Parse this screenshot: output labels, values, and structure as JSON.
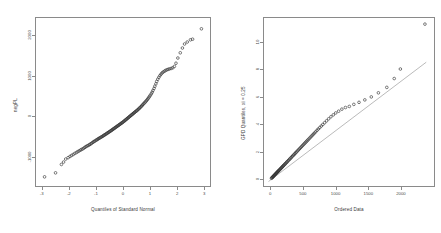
{
  "figure": {
    "background": "#ffffff",
    "frame_color": "#8a8a8a",
    "point_color": "#333333",
    "line_color": "#8a8a8a",
    "panels": 2
  },
  "chart_data": [
    {
      "type": "scatter",
      "panel": "left",
      "title": "",
      "xlabel": "Quantiles of Standard Normal",
      "ylabel": "negPL",
      "xlim": [
        -3.25,
        3.25
      ],
      "ylim": [
        -1750,
        2450
      ],
      "xticks": [
        -3,
        -2,
        -1,
        0,
        1,
        2,
        3
      ],
      "xticklabels": [
        "-3",
        "-2",
        "-1",
        "0",
        "1",
        "2",
        "3"
      ],
      "yticks": [
        -1000,
        0,
        1000,
        2000
      ],
      "yticklabels": [
        "-1000",
        "0",
        "1000",
        "2000"
      ],
      "grid": false,
      "legend": null,
      "marker": "open-circle",
      "reference_line": false,
      "x": [
        -2.93,
        -2.52,
        -2.3,
        -2.22,
        -2.14,
        -2.05,
        -1.98,
        -1.92,
        -1.86,
        -1.8,
        -1.74,
        -1.69,
        -1.64,
        -1.59,
        -1.55,
        -1.5,
        -1.46,
        -1.42,
        -1.38,
        -1.34,
        -1.3,
        -1.26,
        -1.23,
        -1.19,
        -1.16,
        -1.12,
        -1.09,
        -1.06,
        -1.02,
        -0.99,
        -0.96,
        -0.93,
        -0.9,
        -0.87,
        -0.84,
        -0.81,
        -0.78,
        -0.75,
        -0.72,
        -0.7,
        -0.67,
        -0.64,
        -0.61,
        -0.59,
        -0.56,
        -0.53,
        -0.51,
        -0.48,
        -0.45,
        -0.43,
        -0.4,
        -0.38,
        -0.35,
        -0.33,
        -0.3,
        -0.28,
        -0.25,
        -0.23,
        -0.2,
        -0.18,
        -0.15,
        -0.13,
        -0.1,
        -0.08,
        -0.05,
        -0.03,
        0.0,
        0.03,
        0.05,
        0.08,
        0.1,
        0.13,
        0.15,
        0.18,
        0.2,
        0.23,
        0.25,
        0.28,
        0.3,
        0.33,
        0.35,
        0.38,
        0.4,
        0.43,
        0.45,
        0.48,
        0.51,
        0.53,
        0.56,
        0.59,
        0.61,
        0.64,
        0.67,
        0.7,
        0.72,
        0.75,
        0.78,
        0.81,
        0.84,
        0.87,
        0.9,
        0.93,
        0.96,
        0.99,
        1.02,
        1.06,
        1.09,
        1.12,
        1.16,
        1.19,
        1.23,
        1.26,
        1.3,
        1.34,
        1.38,
        1.42,
        1.46,
        1.5,
        1.55,
        1.59,
        1.64,
        1.69,
        1.74,
        1.8,
        1.86,
        1.92,
        1.98,
        2.05,
        2.14,
        2.22,
        2.3,
        2.4,
        2.52,
        2.6,
        2.93
      ],
      "y": [
        -1520,
        -1420,
        -1210,
        -1150,
        -1075,
        -1040,
        -1010,
        -985,
        -960,
        -935,
        -912,
        -890,
        -872,
        -852,
        -835,
        -820,
        -800,
        -782,
        -762,
        -748,
        -735,
        -720,
        -705,
        -690,
        -672,
        -655,
        -640,
        -628,
        -612,
        -598,
        -585,
        -572,
        -560,
        -548,
        -536,
        -524,
        -512,
        -500,
        -488,
        -476,
        -464,
        -452,
        -440,
        -428,
        -416,
        -404,
        -392,
        -380,
        -368,
        -356,
        -344,
        -332,
        -320,
        -308,
        -296,
        -284,
        -272,
        -260,
        -248,
        -236,
        -224,
        -212,
        -200,
        -188,
        -176,
        -164,
        -150,
        -136,
        -122,
        -108,
        -94,
        -80,
        -66,
        -52,
        -38,
        -24,
        -10,
        4,
        18,
        32,
        46,
        60,
        74,
        88,
        102,
        116,
        130,
        146,
        162,
        178,
        196,
        214,
        232,
        252,
        272,
        292,
        312,
        334,
        356,
        380,
        404,
        430,
        458,
        488,
        520,
        556,
        596,
        640,
        690,
        745,
        805,
        865,
        920,
        968,
        1010,
        1045,
        1075,
        1100,
        1120,
        1140,
        1155,
        1168,
        1178,
        1190,
        1205,
        1240,
        1320,
        1450,
        1580,
        1700,
        1800,
        1850,
        1905,
        1920,
        2180
      ]
    },
    {
      "type": "scatter",
      "panel": "right",
      "title": "",
      "xlabel": "Ordered Data",
      "ylabel": "GPD Quantiles, xi = 0.25",
      "xlim": [
        -110,
        2520
      ],
      "ylim": [
        -0.55,
        11.8
      ],
      "xticks": [
        0,
        500,
        1000,
        1500,
        2000
      ],
      "xticklabels": [
        "0",
        "500",
        "1000",
        "1500",
        "2000"
      ],
      "yticks": [
        0,
        2,
        4,
        6,
        8,
        10
      ],
      "yticklabels": [
        "0",
        "2",
        "4",
        "6",
        "8",
        "10"
      ],
      "grid": false,
      "legend": null,
      "marker": "open-circle",
      "reference_line": true,
      "reference_line_points": [
        [
          -40,
          -0.22
        ],
        [
          2400,
          8.55
        ]
      ],
      "x": [
        5,
        12,
        18,
        24,
        30,
        36,
        42,
        48,
        54,
        60,
        66,
        72,
        78,
        84,
        90,
        96,
        102,
        108,
        114,
        120,
        128,
        136,
        144,
        152,
        160,
        168,
        176,
        184,
        192,
        200,
        210,
        220,
        230,
        240,
        250,
        262,
        274,
        286,
        298,
        310,
        322,
        334,
        346,
        358,
        370,
        382,
        394,
        408,
        422,
        436,
        450,
        464,
        478,
        492,
        506,
        520,
        534,
        548,
        562,
        576,
        592,
        608,
        624,
        640,
        656,
        672,
        690,
        710,
        730,
        752,
        776,
        800,
        828,
        858,
        890,
        925,
        962,
        1000,
        1045,
        1095,
        1150,
        1210,
        1280,
        1360,
        1450,
        1550,
        1660,
        1790,
        1905,
        2000,
        2380
      ],
      "y": [
        0.02,
        0.05,
        0.08,
        0.11,
        0.14,
        0.17,
        0.2,
        0.23,
        0.26,
        0.29,
        0.32,
        0.35,
        0.38,
        0.41,
        0.44,
        0.47,
        0.5,
        0.53,
        0.56,
        0.59,
        0.63,
        0.67,
        0.71,
        0.75,
        0.79,
        0.83,
        0.87,
        0.91,
        0.95,
        0.99,
        1.04,
        1.09,
        1.14,
        1.19,
        1.24,
        1.3,
        1.36,
        1.42,
        1.48,
        1.54,
        1.6,
        1.66,
        1.72,
        1.78,
        1.84,
        1.9,
        1.96,
        2.03,
        2.1,
        2.17,
        2.24,
        2.31,
        2.38,
        2.45,
        2.52,
        2.59,
        2.66,
        2.73,
        2.8,
        2.87,
        2.95,
        3.03,
        3.11,
        3.19,
        3.27,
        3.35,
        3.44,
        3.54,
        3.64,
        3.74,
        3.86,
        3.97,
        4.1,
        4.24,
        4.39,
        4.54,
        4.68,
        4.82,
        4.95,
        5.1,
        5.22,
        5.3,
        5.45,
        5.6,
        5.78,
        6.0,
        6.3,
        6.7,
        7.35,
        8.05,
        11.35
      ]
    }
  ],
  "left_panel": {
    "xlabel": "Quantiles of Standard Normal",
    "ylabel": "negPL",
    "xticklabels": [
      "-3",
      "-2",
      "-1",
      "0",
      "1",
      "2",
      "3"
    ],
    "yticklabels": [
      "-1000",
      "0",
      "1000",
      "2000"
    ]
  },
  "right_panel": {
    "xlabel": "Ordered Data",
    "ylabel": "GPD Quantiles, xi = 0.25",
    "xticklabels": [
      "0",
      "500",
      "1000",
      "1500",
      "2000"
    ],
    "yticklabels": [
      "0",
      "2",
      "4",
      "6",
      "8",
      "10"
    ]
  }
}
